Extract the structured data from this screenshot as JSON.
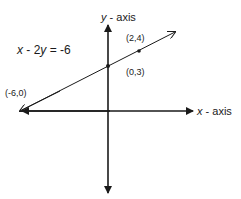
{
  "figure": {
    "equation_var1": "x",
    "equation_mid": " - 2",
    "equation_var2": "y",
    "equation_rhs": " = -6",
    "y_axis_var": "y",
    "y_axis_suffix": " - axis",
    "x_axis_var": "x",
    "x_axis_suffix": " - axis",
    "points": [
      {
        "label": "(-6,0)",
        "x": -6,
        "y": 0
      },
      {
        "label": "(0,3)",
        "x": 0,
        "y": 3
      },
      {
        "label": "(2,4)",
        "x": 2,
        "y": 4
      }
    ],
    "line_color": "#1a1a1a"
  }
}
